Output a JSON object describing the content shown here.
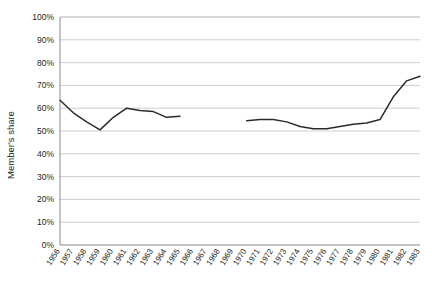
{
  "chart_data": {
    "type": "line",
    "title": "",
    "subtitle": "",
    "xlabel": "",
    "ylabel": "Member's share",
    "ylim": [
      0,
      100
    ],
    "yunit": "%",
    "grid": true,
    "legend": false,
    "legend_position": "none",
    "line_color": "#2b2b2b",
    "grid_color": "#b8b8b8",
    "axis_color": "#6d6d6d",
    "note": "Single series plotted with a data gap between 1965 and 1970",
    "categories": [
      "1956",
      "1957",
      "1958",
      "1959",
      "1960",
      "1961",
      "1962",
      "1963",
      "1964",
      "1965",
      "1966",
      "1967",
      "1968",
      "1969",
      "1970",
      "1971",
      "1972",
      "1973",
      "1974",
      "1975",
      "1976",
      "1977",
      "1978",
      "1979",
      "1980",
      "1981",
      "1982",
      "1983"
    ],
    "ytick_labels": [
      "0%",
      "10%",
      "20%",
      "30%",
      "40%",
      "50%",
      "60%",
      "70%",
      "80%",
      "90%",
      "100%"
    ],
    "ytick_values": [
      0,
      10,
      20,
      30,
      40,
      50,
      60,
      70,
      80,
      90,
      100
    ],
    "series": [
      {
        "name": "Member's share",
        "values": [
          63.5,
          58,
          54,
          50.5,
          56,
          60,
          59,
          58.5,
          56,
          56.5,
          null,
          null,
          null,
          null,
          54.5,
          55,
          55,
          54,
          52,
          51,
          51,
          52,
          53,
          53.5,
          55,
          65,
          72,
          74
        ]
      }
    ]
  }
}
